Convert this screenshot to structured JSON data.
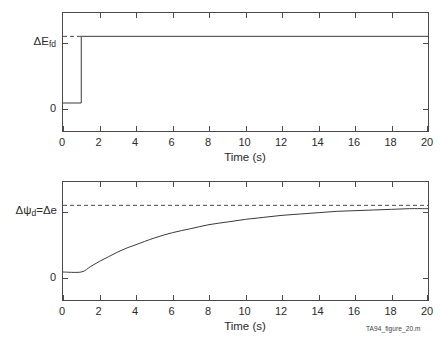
{
  "figure": {
    "caption": "TA94_figure_20.m",
    "background_color": "#ffffff",
    "line_color": "#3a3a3a",
    "axis_color": "#4a4a4a"
  },
  "chart_data": [
    {
      "type": "line",
      "title": "",
      "subtitle": "",
      "xlabel": "Time (s)",
      "ylabel": "ΔE_fd",
      "ylabel_base": "ΔE",
      "ylabel_sub": "fd",
      "xlim": [
        0,
        20
      ],
      "ylim": [
        -0.45,
        1.35
      ],
      "xticks": [
        0,
        2,
        4,
        6,
        8,
        10,
        12,
        14,
        16,
        18,
        20
      ],
      "xticklabels": [
        "0",
        "2",
        "4",
        "6",
        "8",
        "10",
        "12",
        "14",
        "16",
        "18",
        "20"
      ],
      "yticks": [
        0,
        1
      ],
      "yticklabels": [
        "0",
        "ΔE_fd"
      ],
      "grid": false,
      "legend": null,
      "annotations": [
        {
          "text": "step input applied at t = 1 s",
          "type": "step-transition",
          "x": 1
        }
      ],
      "series": [
        {
          "name": "ΔE_fd step input",
          "style": "solid",
          "x": [
            0,
            1,
            1,
            20
          ],
          "values": [
            0,
            0,
            1,
            1
          ]
        },
        {
          "name": "final value marker",
          "style": "dashed",
          "x": [
            0,
            1
          ],
          "values": [
            1,
            1
          ]
        }
      ]
    },
    {
      "type": "line",
      "title": "",
      "subtitle": "",
      "xlabel": "Time (s)",
      "ylabel": "Δψ_d=Δe",
      "ylabel_base": "Δψ",
      "ylabel_sub": "d",
      "ylabel_tail": "=Δe",
      "xlim": [
        0,
        20
      ],
      "ylim": [
        -0.45,
        1.35
      ],
      "xticks": [
        0,
        2,
        4,
        6,
        8,
        10,
        12,
        14,
        16,
        18,
        20
      ],
      "xticklabels": [
        "0",
        "2",
        "4",
        "6",
        "8",
        "10",
        "12",
        "14",
        "16",
        "18",
        "20"
      ],
      "yticks": [
        0,
        1
      ],
      "yticklabels": [
        "0",
        "Δψ_d=Δe"
      ],
      "grid": false,
      "legend": null,
      "annotations": [
        {
          "text": "steady-state asymptote",
          "type": "asymptote",
          "y": 1
        }
      ],
      "series": [
        {
          "name": "Δψ_d exponential response",
          "style": "solid",
          "x": [
            0,
            1,
            1.5,
            2,
            2.5,
            3,
            3.5,
            4,
            5,
            6,
            7,
            8,
            9,
            10,
            11,
            12,
            13,
            14,
            15,
            16,
            17,
            18,
            19,
            20
          ],
          "values": [
            0,
            0,
            0.08,
            0.16,
            0.23,
            0.3,
            0.36,
            0.41,
            0.51,
            0.59,
            0.65,
            0.71,
            0.75,
            0.79,
            0.82,
            0.85,
            0.87,
            0.89,
            0.91,
            0.92,
            0.93,
            0.94,
            0.95,
            0.95
          ]
        },
        {
          "name": "asymptote Δe",
          "style": "dashed",
          "x": [
            0,
            20
          ],
          "values": [
            1,
            1
          ]
        }
      ]
    }
  ]
}
